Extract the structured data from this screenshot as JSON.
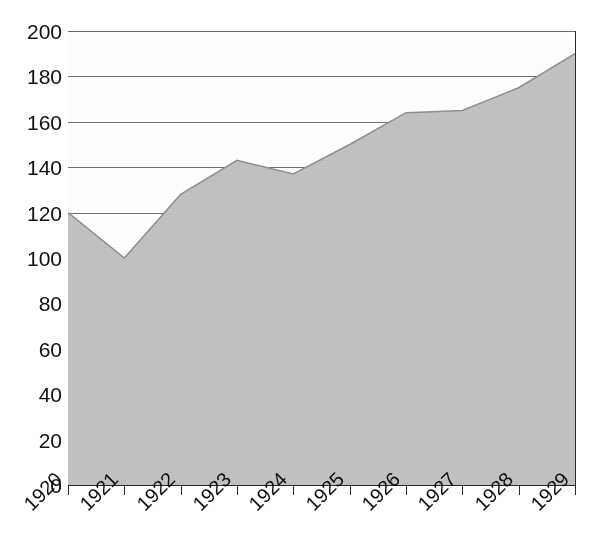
{
  "chart_data": {
    "type": "area",
    "title": "",
    "xlabel": "",
    "ylabel": "",
    "categories": [
      "1920",
      "1921",
      "1922",
      "1923",
      "1924",
      "1925",
      "1926",
      "1927",
      "1928",
      "1929"
    ],
    "values": [
      120,
      100,
      128,
      143,
      137,
      150,
      164,
      165,
      175,
      190
    ],
    "series": [
      {
        "name": "Index",
        "values": [
          120,
          100,
          128,
          143,
          137,
          150,
          164,
          165,
          175,
          190
        ]
      }
    ],
    "ylim": [
      0,
      200
    ],
    "yticks": [
      0,
      20,
      40,
      60,
      80,
      100,
      120,
      140,
      160,
      180,
      200
    ],
    "ytick_labels": [
      "0",
      "20",
      "40",
      "60",
      "80",
      "100",
      "120",
      "140",
      "160",
      "180",
      "200"
    ],
    "xtick_labels": [
      "1920",
      "1921",
      "1922",
      "1923",
      "1924",
      "1925",
      "1926",
      "1927",
      "1928",
      "1929"
    ],
    "grid": true,
    "grid_orientation": "horizontal",
    "legend": false,
    "legend_position": "none",
    "xtick_label_rotation": -45,
    "colors": {
      "area_fill": "#c2c2c2",
      "area_edge": "#8f8f8f",
      "gridline": "#6f6f6f",
      "axis": "#2a2a2a",
      "text": "#111111",
      "background": "#ffffff"
    }
  },
  "axes": {
    "y_labels": [
      {
        "text": "200",
        "value": 200
      },
      {
        "text": "180",
        "value": 180
      },
      {
        "text": "160",
        "value": 160
      },
      {
        "text": "140",
        "value": 140
      },
      {
        "text": "120",
        "value": 120
      },
      {
        "text": "100",
        "value": 100
      },
      {
        "text": "80",
        "value": 80
      },
      {
        "text": "60",
        "value": 60
      },
      {
        "text": "40",
        "value": 40
      },
      {
        "text": "20",
        "value": 20
      },
      {
        "text": "0",
        "value": 0
      }
    ],
    "x_labels": [
      {
        "text": "1920"
      },
      {
        "text": "1921"
      },
      {
        "text": "1922"
      },
      {
        "text": "1923"
      },
      {
        "text": "1924"
      },
      {
        "text": "1925"
      },
      {
        "text": "1926"
      },
      {
        "text": "1927"
      },
      {
        "text": "1928"
      },
      {
        "text": "1929"
      }
    ]
  },
  "header": {
    "clipped_title": ""
  }
}
